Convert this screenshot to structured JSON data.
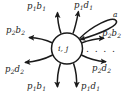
{
  "diagram": {
    "type": "state-transition-diagram",
    "center_node": {
      "label_html": "i, j",
      "shape": "circle"
    },
    "self_loop": {
      "label": "a"
    },
    "ellipsis": "․ ․ ․ ․",
    "arrows": [
      {
        "id": "top-left",
        "label_base": "p",
        "label_sub1": "1",
        "label_var": "b",
        "label_sub2": "1",
        "direction": "out-up"
      },
      {
        "id": "top-right",
        "label_base": "p",
        "label_sub1": "1",
        "label_var": "d",
        "label_sub2": "1",
        "direction": "out-up"
      },
      {
        "id": "left-upper",
        "label_base": "p",
        "label_sub1": "2",
        "label_var": "b",
        "label_sub2": "2",
        "direction": "out-left"
      },
      {
        "id": "left-lower",
        "label_base": "p",
        "label_sub1": "2",
        "label_var": "d",
        "label_sub2": "2",
        "direction": "out-left"
      },
      {
        "id": "right-upper",
        "label_base": "p",
        "label_sub1": "2",
        "label_var": "b",
        "label_sub2": "2",
        "direction": "out-right"
      },
      {
        "id": "right-lower",
        "label_base": "p",
        "label_sub1": "2",
        "label_var": "d",
        "label_sub2": "2",
        "direction": "out-right"
      },
      {
        "id": "bottom-left",
        "label_base": "p",
        "label_sub1": "1",
        "label_var": "b",
        "label_sub2": "1",
        "direction": "out-down"
      },
      {
        "id": "bottom-right",
        "label_base": "p",
        "label_sub1": "1",
        "label_var": "d",
        "label_sub2": "1",
        "direction": "out-down"
      }
    ],
    "labels": {
      "top_left": {
        "p": "p",
        "p_sub": "1",
        "v": "b",
        "v_sub": "1"
      },
      "top_right": {
        "p": "p",
        "p_sub": "1",
        "v": "d",
        "v_sub": "1"
      },
      "left_upper": {
        "p": "p",
        "p_sub": "2",
        "v": "b",
        "v_sub": "2"
      },
      "left_lower": {
        "p": "p",
        "p_sub": "2",
        "v": "d",
        "v_sub": "2"
      },
      "right_upper": {
        "p": "p",
        "p_sub": "2",
        "v": "b",
        "v_sub": "2"
      },
      "right_lower": {
        "p": "p",
        "p_sub": "2",
        "v": "d",
        "v_sub": "2"
      },
      "bottom_left": {
        "p": "p",
        "p_sub": "1",
        "v": "b",
        "v_sub": "1"
      },
      "bottom_right": {
        "p": "p",
        "p_sub": "1",
        "v": "d",
        "v_sub": "1"
      },
      "loop": "a",
      "center": "i, j"
    },
    "colors": {
      "stroke": "#1a1a1a",
      "background": "#ffffff",
      "text": "#1a1a1a"
    }
  }
}
